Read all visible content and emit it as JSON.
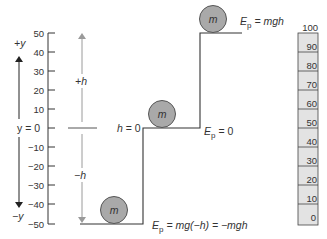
{
  "diagram": {
    "axis": {
      "positive_label": "+y",
      "negative_label": "−y",
      "zero_label": "y = 0",
      "ticks": [
        "50",
        "40",
        "30",
        "20",
        "10",
        "0",
        "−10",
        "−20",
        "−30",
        "−40",
        "−50"
      ]
    },
    "height_arrows": {
      "up_label": "+h",
      "down_label": "−h",
      "zero_label": "h = 0"
    },
    "balls": [
      {
        "label": "m",
        "position": "top"
      },
      {
        "label": "m",
        "position": "middle"
      },
      {
        "label": "m",
        "position": "bottom"
      }
    ],
    "energy_labels": {
      "top": {
        "symbol": "E",
        "sub": "p",
        "expr": " = mgh"
      },
      "middle": {
        "symbol": "E",
        "sub": "p",
        "expr": " = 0"
      },
      "bottom": {
        "symbol": "E",
        "sub": "p",
        "expr": " = mg(−h) = −mgh"
      }
    },
    "ruler": {
      "ticks": [
        "100",
        "90",
        "80",
        "70",
        "60",
        "50",
        "40",
        "30",
        "20",
        "10",
        "0"
      ]
    },
    "colors": {
      "ball_fill": "#a9a9a9",
      "ball_stroke": "#555555",
      "ruler_fill": "#e3e3e3",
      "arrow_gray": "#9a9a9a",
      "line": "#333333"
    }
  }
}
